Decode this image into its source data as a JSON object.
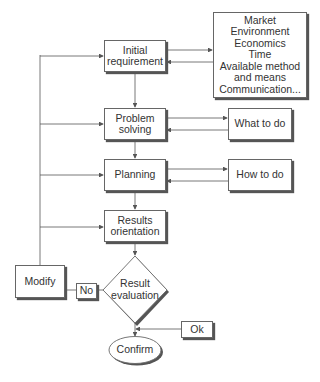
{
  "diagram": {
    "nodes": {
      "initial_requirement": "Initial\nrequirement",
      "factors": "Market\nEnvironment\nEconomics\nTime\nAvailable method\nand means\nCommunication...",
      "problem_solving": "Problem\nsolving",
      "what_to_do": "What to do",
      "planning": "Planning",
      "how_to_do": "How to do",
      "results_orientation": "Results\norientation",
      "result_evaluation": "Result\nevaluation",
      "modify": "Modify",
      "no": "No",
      "ok": "Ok",
      "confirm": "Confirm"
    },
    "colors": {
      "line": "#555555",
      "border": "#666666",
      "shadow": "#555555",
      "text": "#333333",
      "background": "#ffffff"
    }
  }
}
